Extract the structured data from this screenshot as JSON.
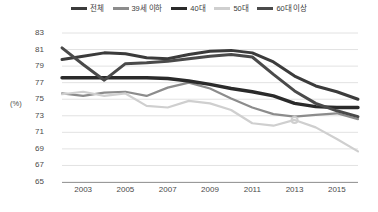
{
  "chart_data": {
    "type": "line",
    "title": "",
    "subtitle": "",
    "xlabel": "",
    "ylabel": "(%)",
    "ylim": [
      65,
      83
    ],
    "y_ticks": [
      83,
      81,
      79,
      77,
      75,
      73,
      71,
      69,
      67,
      65
    ],
    "x": [
      2002,
      2003,
      2004,
      2005,
      2006,
      2007,
      2008,
      2009,
      2010,
      2011,
      2012,
      2013,
      2014,
      2015,
      2016
    ],
    "x_tick_labels": [
      "2003",
      "2005",
      "2007",
      "2009",
      "2011",
      "2013",
      "2015"
    ],
    "x_tick_values": [
      2003,
      2005,
      2007,
      2009,
      2011,
      2013,
      2015
    ],
    "grid": true,
    "grid_axis": "y",
    "legend_position": "top-center",
    "series": [
      {
        "name": "전체",
        "color": "#3b3b3b",
        "width": 3.0,
        "values": [
          79.8,
          80.2,
          80.6,
          80.5,
          80.0,
          79.9,
          80.4,
          80.8,
          80.9,
          80.6,
          79.5,
          77.8,
          76.6,
          75.9,
          75.0
        ]
      },
      {
        "name": "39세 이하",
        "color": "#8c8c8c",
        "width": 2.2,
        "values": [
          75.7,
          75.4,
          75.8,
          75.9,
          75.4,
          76.4,
          77.0,
          76.3,
          75.1,
          74.0,
          73.2,
          72.9,
          73.1,
          73.3,
          72.6
        ]
      },
      {
        "name": "40대",
        "color": "#2a2a2a",
        "width": 3.4,
        "values": [
          77.6,
          77.6,
          77.6,
          77.6,
          77.6,
          77.5,
          77.2,
          76.8,
          76.3,
          75.9,
          75.4,
          74.5,
          74.1,
          74.0,
          74.0
        ]
      },
      {
        "name": "50대",
        "color": "#cfcfcf",
        "width": 2.2,
        "values": [
          75.6,
          75.9,
          75.4,
          75.7,
          74.2,
          74.0,
          74.8,
          74.5,
          73.7,
          72.1,
          71.8,
          72.5,
          71.6,
          70.2,
          68.7
        ]
      },
      {
        "name": "60대 이상",
        "color": "#4a4a4a",
        "width": 3.0,
        "values": [
          81.2,
          79.2,
          77.3,
          79.3,
          79.4,
          79.6,
          79.9,
          80.2,
          80.4,
          80.1,
          78.0,
          76.0,
          74.5,
          73.6,
          72.9
        ]
      }
    ],
    "markers": [
      {
        "series": "50대",
        "x": 2013,
        "y": 72.5
      }
    ]
  }
}
